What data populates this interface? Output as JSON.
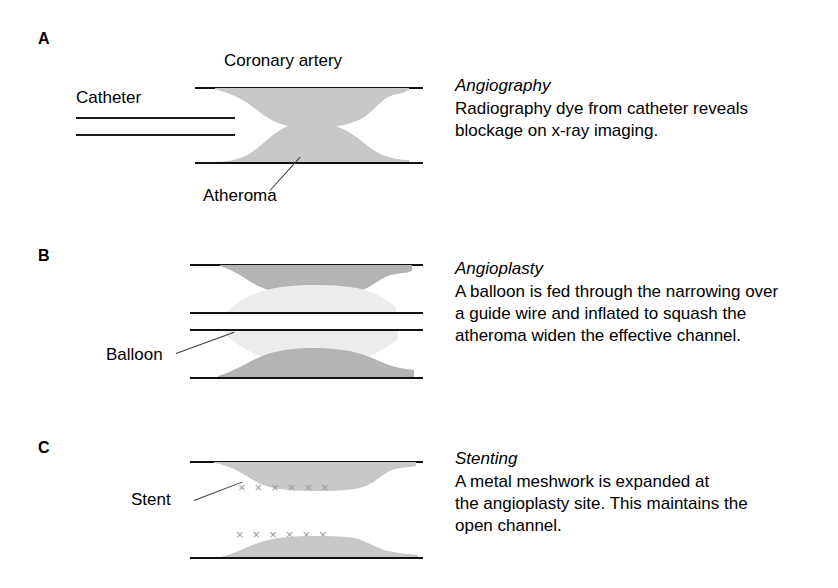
{
  "figure": {
    "background_color": "#ffffff",
    "line_color": "#111111",
    "atheroma_color": "#c8c8c8",
    "balloon_color": "#ececec",
    "stent_mark_color": "#9a9a9a",
    "text_color": "#000000"
  },
  "panels": [
    {
      "letter": "A",
      "title": "Angiography",
      "body": "Radiography dye from catheter reveals\nblockage on x-ray imaging.",
      "labels": {
        "top": "Coronary artery",
        "left": "Catheter",
        "bottom": "Atheroma"
      }
    },
    {
      "letter": "B",
      "title": "Angioplasty",
      "body": "A balloon is fed through the narrowing over\na guide wire and inflated to squash the\natheroma widen the effective channel.",
      "labels": {
        "left": "Balloon"
      }
    },
    {
      "letter": "C",
      "title": "Stenting",
      "body": "A metal meshwork is expanded at\nthe angioplasty site. This maintains the\nopen channel.",
      "labels": {
        "left": "Stent"
      },
      "stent_marks": {
        "glyph": "×",
        "upper_row_count": 6,
        "lower_row_count": 6
      }
    }
  ]
}
